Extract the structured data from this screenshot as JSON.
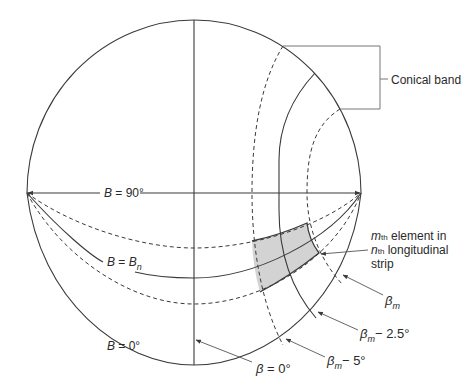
{
  "figure": {
    "type": "spherical-coordinate-grid",
    "labels": {
      "conical_band": "Conical band",
      "b90": "B = 90°",
      "bn_prefix": "B = B",
      "bn_sub": "n",
      "b0": "B = 0°",
      "beta0": "β = 0°",
      "beta_m": "β",
      "beta_m_sub": "m",
      "beta_m_2_5": "− 2.5°",
      "beta_m_5": "− 5°",
      "element_line1_m": "m",
      "element_line1_th": "th",
      "element_line1_rest": " element in",
      "element_line2_n": "n",
      "element_line2_th": "th",
      "element_line2_rest": " longitudinal",
      "element_line3": "strip"
    },
    "colors": {
      "line": "#3a3a3a",
      "shade": "#d3d3d3",
      "leader": "#555555"
    }
  }
}
